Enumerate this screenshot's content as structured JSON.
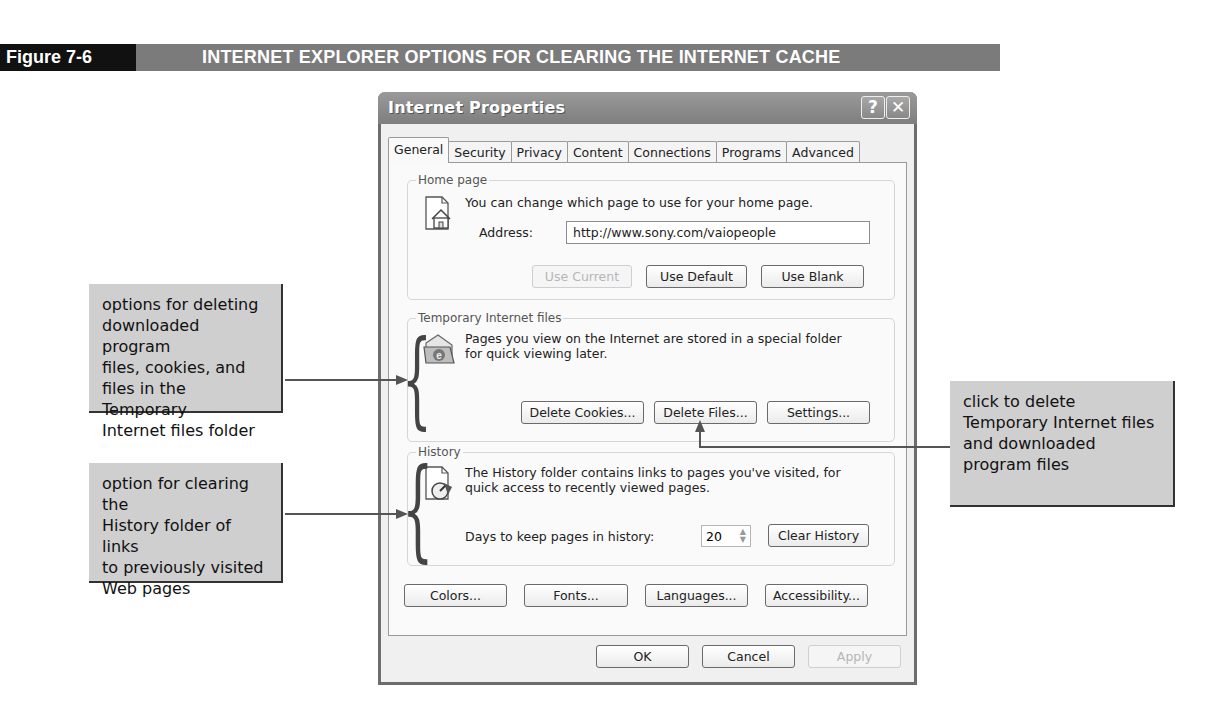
{
  "figure": {
    "number": "Figure 7-6",
    "title": "INTERNET EXPLORER OPTIONS FOR CLEARING THE INTERNET CACHE"
  },
  "dialog": {
    "title": "Internet Properties",
    "help_button": "?",
    "close_button": "✕",
    "tabs": [
      {
        "label": "General",
        "active": true
      },
      {
        "label": "Security"
      },
      {
        "label": "Privacy"
      },
      {
        "label": "Content"
      },
      {
        "label": "Connections"
      },
      {
        "label": "Programs"
      },
      {
        "label": "Advanced"
      }
    ],
    "home_page": {
      "group_label": "Home page",
      "description": "You can change which page to use for your home page.",
      "address_label": "Address:",
      "address_value": "http://www.sony.com/vaiopeople",
      "buttons": {
        "use_current": "Use Current",
        "use_default": "Use Default",
        "use_blank": "Use Blank"
      }
    },
    "temp_files": {
      "group_label": "Temporary Internet files",
      "description_line1": "Pages you view on the Internet are stored in a special folder",
      "description_line2": "for quick viewing later.",
      "buttons": {
        "delete_cookies": "Delete Cookies...",
        "delete_files": "Delete Files...",
        "settings": "Settings..."
      }
    },
    "history": {
      "group_label": "History",
      "description_line1": "The History folder contains links to pages you've visited, for",
      "description_line2": "quick access to recently viewed pages.",
      "days_label": "Days to keep pages in history:",
      "days_value": "20",
      "clear_button": "Clear History"
    },
    "bottom_buttons": {
      "colors": "Colors...",
      "fonts": "Fonts...",
      "languages": "Languages...",
      "accessibility": "Accessibility..."
    },
    "footer": {
      "ok": "OK",
      "cancel": "Cancel",
      "apply": "Apply"
    }
  },
  "callouts": {
    "temp_files": {
      "lines": [
        "options for deleting",
        "downloaded program",
        "files, cookies, and",
        "files in the Temporary",
        "Internet files folder"
      ]
    },
    "history": {
      "lines": [
        "option for clearing the",
        "History folder of links",
        "to previously visited",
        "Web pages"
      ]
    },
    "delete_files": {
      "lines": [
        "click to delete",
        "Temporary Internet files",
        "and downloaded",
        "program files"
      ]
    }
  }
}
